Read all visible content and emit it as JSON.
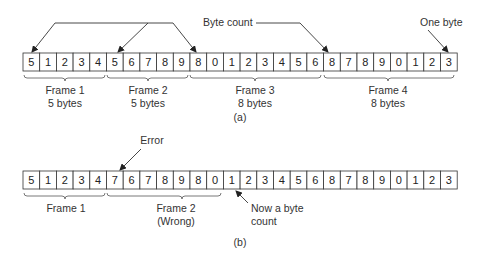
{
  "part_a": {
    "bytes": [
      "5",
      "1",
      "2",
      "3",
      "4",
      "5",
      "6",
      "7",
      "8",
      "9",
      "8",
      "0",
      "1",
      "2",
      "3",
      "4",
      "5",
      "6",
      "8",
      "7",
      "8",
      "9",
      "0",
      "1",
      "2",
      "3"
    ],
    "frames": [
      {
        "name": "Frame 1",
        "size": "5 bytes"
      },
      {
        "name": "Frame 2",
        "size": "5 bytes"
      },
      {
        "name": "Frame 3",
        "size": "8 bytes"
      },
      {
        "name": "Frame 4",
        "size": "8 bytes"
      }
    ],
    "annotations": {
      "byte_count": "Byte count",
      "one_byte": "One byte"
    },
    "caption": "(a)"
  },
  "part_b": {
    "bytes": [
      "5",
      "1",
      "2",
      "3",
      "4",
      "7",
      "6",
      "7",
      "8",
      "9",
      "8",
      "0",
      "1",
      "2",
      "3",
      "4",
      "5",
      "6",
      "8",
      "7",
      "8",
      "9",
      "0",
      "1",
      "2",
      "3"
    ],
    "frames": [
      {
        "name": "Frame 1"
      },
      {
        "name": "Frame 2",
        "note": "(Wrong)"
      }
    ],
    "annotations": {
      "error": "Error",
      "now_count_line1": "Now a byte",
      "now_count_line2": "count"
    },
    "caption": "(b)"
  }
}
